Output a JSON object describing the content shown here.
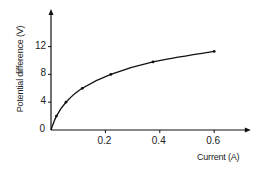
{
  "chart_data": {
    "type": "line",
    "title": "",
    "xlabel": "Current (A)",
    "ylabel": "Potential difference (V)",
    "x": [
      0,
      0.02,
      0.055,
      0.115,
      0.22,
      0.375,
      0.6
    ],
    "series": [
      {
        "name": "V-I characteristic",
        "values": [
          0,
          2,
          4,
          6,
          8,
          9.8,
          11.3
        ]
      }
    ],
    "xlim": [
      0,
      0.72
    ],
    "ylim": [
      0,
      16.5
    ],
    "xticks": [
      0.2,
      0.4,
      0.6
    ],
    "xtick_labels": [
      "0.2",
      "0.4",
      "0.6"
    ],
    "yticks": [
      0,
      4,
      8,
      12
    ],
    "ytick_labels": [
      "0",
      "4",
      "8",
      "12"
    ],
    "grid": false,
    "legend": "none",
    "smooth_curve": true,
    "markers": true
  },
  "colors": {
    "axis": "#111111",
    "line": "#111111",
    "text": "#222222"
  }
}
